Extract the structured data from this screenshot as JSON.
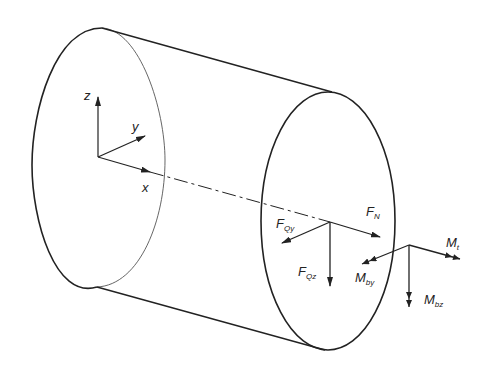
{
  "diagram": {
    "axes": {
      "x": "x",
      "y": "y",
      "z": "z"
    },
    "forces": {
      "FN": {
        "main": "F",
        "sub": "N"
      },
      "FQy": {
        "main": "F",
        "sub": "Qy"
      },
      "FQz": {
        "main": "F",
        "sub": "Qz"
      }
    },
    "moments": {
      "Mt": {
        "main": "M",
        "sub": "t"
      },
      "Mby": {
        "main": "M",
        "sub": "by"
      },
      "Mbz": {
        "main": "M",
        "sub": "bz"
      }
    },
    "colors": {
      "line": "#222222",
      "background": "#ffffff"
    }
  }
}
